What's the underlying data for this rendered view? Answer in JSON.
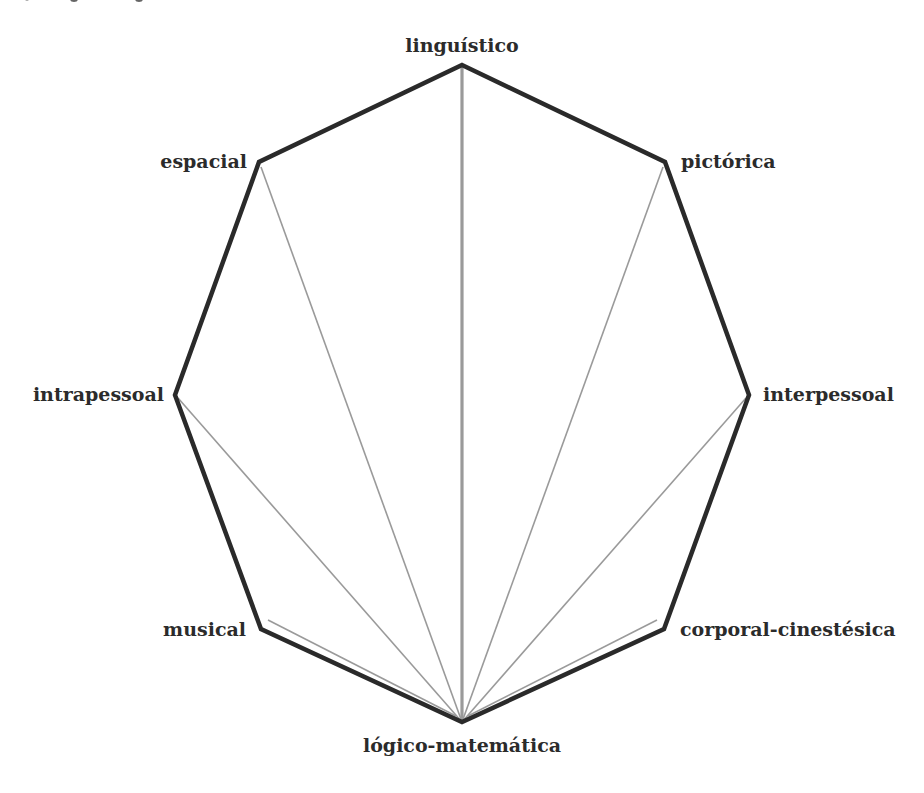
{
  "diagram": {
    "title": "",
    "shape": "octagon",
    "top_cropped_text": "",
    "colors": {
      "outline": "#2a2a2a",
      "spokes": "#9a9a9a",
      "labels": "#2b2b2b",
      "background": "#ffffff"
    },
    "nodes": [
      {
        "id": "linguistico",
        "label": "linguístico",
        "x": 462,
        "y": 65
      },
      {
        "id": "pictorica",
        "label": "pictórica",
        "x": 665,
        "y": 162
      },
      {
        "id": "interpessoal",
        "label": "interpessoal",
        "x": 749,
        "y": 395
      },
      {
        "id": "corporal",
        "label": "corporal-cinestésica",
        "x": 664,
        "y": 629
      },
      {
        "id": "logico",
        "label": "lógico-matemática",
        "x": 462,
        "y": 722
      },
      {
        "id": "musical",
        "label": "musical",
        "x": 261,
        "y": 629
      },
      {
        "id": "intrapessoal",
        "label": "intrapessoal",
        "x": 175,
        "y": 395
      },
      {
        "id": "espacial",
        "label": "espacial",
        "x": 259,
        "y": 162
      }
    ],
    "hub": "lógico-matemática",
    "edges": [
      {
        "from": "lógico-matemática",
        "to": "linguístico",
        "weight": "heavy"
      },
      {
        "from": "lógico-matemática",
        "to": "pictórica",
        "weight": "light"
      },
      {
        "from": "lógico-matemática",
        "to": "interpessoal",
        "weight": "light"
      },
      {
        "from": "lógico-matemática",
        "to": "corporal-cinestésica",
        "weight": "light"
      },
      {
        "from": "lógico-matemática",
        "to": "musical",
        "weight": "light"
      },
      {
        "from": "lógico-matemática",
        "to": "intrapessoal",
        "weight": "light"
      },
      {
        "from": "lógico-matemática",
        "to": "espacial",
        "weight": "light"
      }
    ]
  }
}
